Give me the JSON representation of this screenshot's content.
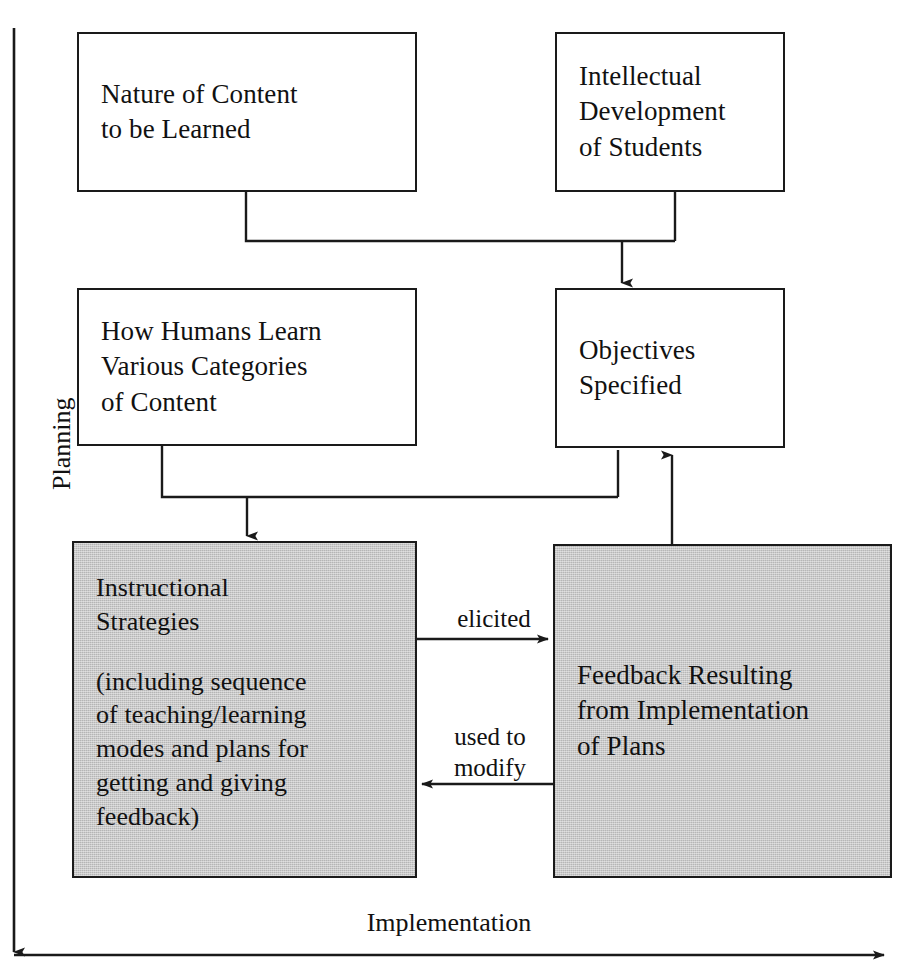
{
  "diagram": {
    "shade_color": "#c3c3c3",
    "line_color": "#1a1a1a",
    "background": "#ffffff",
    "nodes": [
      {
        "id": "nature-of-content",
        "lines": [
          "Nature of Content",
          "to be Learned"
        ],
        "shaded": false
      },
      {
        "id": "intellectual-development",
        "lines": [
          "Intellectual",
          "Development",
          "of Students"
        ],
        "shaded": false
      },
      {
        "id": "how-humans-learn",
        "lines": [
          "How Humans Learn",
          "Various Categories",
          "of Content"
        ],
        "shaded": false
      },
      {
        "id": "objectives-specified",
        "lines": [
          "Objectives",
          "Specified"
        ],
        "shaded": false
      },
      {
        "id": "instructional-strategies",
        "lines": [
          "Instructional",
          "Strategies"
        ],
        "detail_lines": [
          "(including sequence",
          "of teaching/learning",
          "modes and plans for",
          "getting and giving",
          "feedback)"
        ],
        "shaded": true
      },
      {
        "id": "feedback-resulting",
        "lines": [
          "Feedback Resulting",
          "from Implementation",
          "of Plans"
        ],
        "shaded": true
      }
    ],
    "edge_labels": {
      "elicited": "elicited",
      "used_to_modify_line1": "used to",
      "used_to_modify_line2": "modify"
    },
    "axes": {
      "vertical": "Planning",
      "horizontal": "Implementation"
    }
  }
}
